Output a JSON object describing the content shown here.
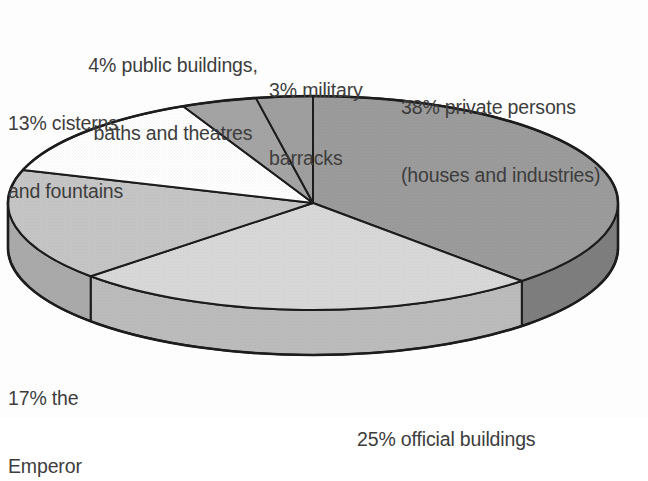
{
  "chart_data": {
    "type": "pie",
    "title": "",
    "subtitle": "",
    "xlabel": "",
    "ylabel": "",
    "legend_position": "none",
    "grid": false,
    "style": "3d-exploded-ellipse",
    "units": "percent",
    "total": 100,
    "categories": [
      "private persons (houses and industries)",
      "official buildings",
      "the Emperor",
      "cisterns and fountains",
      "public buildings, baths and theatres",
      "military barracks"
    ],
    "values": [
      38,
      25,
      17,
      13,
      4,
      3
    ],
    "slices": [
      {
        "id": "private-persons",
        "percent": 38,
        "label_lines": [
          "38% private persons",
          "(houses and industries)"
        ],
        "fill": "#9c9c9c",
        "side_fill": "#7f7f7f",
        "start_angle": 0,
        "end_angle": 136.8
      },
      {
        "id": "official-buildings",
        "percent": 25,
        "label_lines": [
          "25% official buildings"
        ],
        "fill": "#d9d9d9",
        "side_fill": "#bdbdbd",
        "start_angle": 136.8,
        "end_angle": 226.8
      },
      {
        "id": "the-emperor",
        "percent": 17,
        "label_lines": [
          "17% the",
          "Emperor"
        ],
        "fill": "#c6c6c6",
        "side_fill": "#ababab",
        "start_angle": 226.8,
        "end_angle": 288.0
      },
      {
        "id": "cisterns-and-fountains",
        "percent": 13,
        "label_lines": [
          "13% cisterns",
          "and fountains"
        ],
        "fill": "#ffffff",
        "side_fill": "#e8e8e8",
        "start_angle": 288.0,
        "end_angle": 334.8
      },
      {
        "id": "public-buildings",
        "percent": 4,
        "label_lines": [
          "4% public buildings,",
          "baths and theatres"
        ],
        "fill": "#a5a5a5",
        "side_fill": "#8c8c8c",
        "start_angle": 334.8,
        "end_angle": 349.2
      },
      {
        "id": "military-barracks",
        "percent": 3,
        "label_lines": [
          "3% military",
          "barracks"
        ],
        "fill": "#a0a0a0",
        "side_fill": "#888888",
        "start_angle": 349.2,
        "end_angle": 360.0
      }
    ],
    "colors": {
      "outline": "#1c1c1c",
      "text": "#3d3d3d",
      "background": "#fdfdfd"
    }
  },
  "labels": {
    "public_buildings_line1": "4% public buildings,",
    "public_buildings_line2": "baths and theatres",
    "military_barracks_line1": "3% military",
    "military_barracks_line2": "barracks",
    "private_persons_line1": "38% private persons",
    "private_persons_line2": "(houses and industries)",
    "cisterns_line1": "13% cisterns",
    "cisterns_line2": "and fountains",
    "emperor_line1": "17% the",
    "emperor_line2": "Emperor",
    "official_buildings_line1": "25% official buildings"
  }
}
